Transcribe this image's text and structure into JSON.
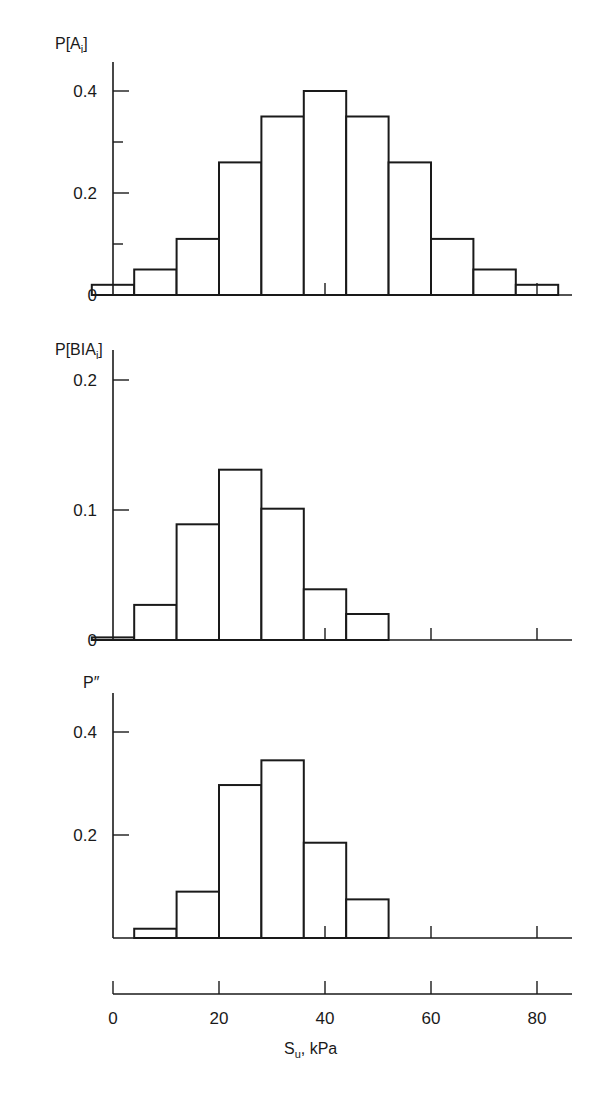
{
  "chart_data": [
    {
      "type": "bar",
      "title": "",
      "ylabel": "P[A_i]",
      "ylabel_main": "P[A",
      "ylabel_sub": "i",
      "ylabel_close": "]",
      "xlabel": "S_u, kPa",
      "x_bin_edges": [
        -4,
        4,
        12,
        20,
        28,
        36,
        44,
        52,
        60,
        68,
        76,
        84
      ],
      "categories": [
        "0",
        "8",
        "16",
        "24",
        "32",
        "40",
        "48",
        "56",
        "64",
        "72",
        "80"
      ],
      "values": [
        0.02,
        0.05,
        0.11,
        0.26,
        0.35,
        0.4,
        0.35,
        0.26,
        0.11,
        0.05,
        0.02
      ],
      "yticks": [
        0,
        0.2,
        0.4
      ],
      "ytick_labels": [
        "0",
        "0.2",
        "0.4"
      ],
      "yminor": [
        0.1,
        0.3
      ],
      "ylim": [
        0,
        0.45
      ],
      "grid": false
    },
    {
      "type": "bar",
      "title": "",
      "ylabel": "P[B|A_i]",
      "ylabel_main": "P[BIA",
      "ylabel_sub": "i",
      "ylabel_close": "]",
      "xlabel": "S_u, kPa",
      "x_bin_edges": [
        -4,
        4,
        12,
        20,
        28,
        36,
        44,
        52
      ],
      "categories": [
        "0",
        "8",
        "16",
        "24",
        "32",
        "40",
        "48"
      ],
      "values": [
        0.002,
        0.027,
        0.089,
        0.131,
        0.101,
        0.039,
        0.02
      ],
      "yticks": [
        0,
        0.1,
        0.2
      ],
      "ytick_labels": [
        "0",
        "0.1",
        "0.2"
      ],
      "ylim": [
        0,
        0.23
      ],
      "grid": false
    },
    {
      "type": "bar",
      "title": "",
      "ylabel": "P''",
      "ylabel_main": "P″",
      "xlabel": "S_u, kPa",
      "x_bin_edges": [
        4,
        12,
        20,
        28,
        36,
        44,
        52
      ],
      "categories": [
        "8",
        "16",
        "24",
        "32",
        "40",
        "48"
      ],
      "values": [
        0.018,
        0.09,
        0.297,
        0.345,
        0.185,
        0.075
      ],
      "yticks": [
        0.2,
        0.4
      ],
      "ytick_labels": [
        "0.2",
        "0.4"
      ],
      "ylim": [
        0,
        0.45
      ],
      "grid": false
    }
  ],
  "shared_x_axis": {
    "label_main": "S",
    "label_sub": "u",
    "label_rest": ", kPa",
    "ticks": [
      0,
      20,
      40,
      60,
      80
    ],
    "tick_labels": [
      "0",
      "20",
      "40",
      "60",
      "80"
    ],
    "xlim": [
      0,
      88
    ]
  }
}
